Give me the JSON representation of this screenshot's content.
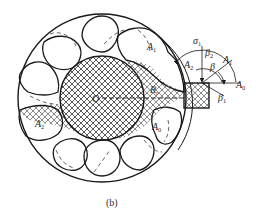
{
  "figure": {
    "caption": "(b)",
    "colors": {
      "stroke": "#1a1a1a",
      "hatch": "#3a3a3a",
      "dashed": "#555555",
      "background": "#ffffff"
    },
    "labels": {
      "center": "O",
      "radius": {
        "main": "R",
        "sub": "r"
      },
      "sigma1": {
        "main": "σ",
        "sub": "1"
      },
      "beta2": {
        "main": "β",
        "sub": "2"
      },
      "beta": {
        "main": "β",
        "sub": ""
      },
      "beta1": {
        "main": "β",
        "sub": "1"
      },
      "a1_right": {
        "main": "A",
        "sub": "1"
      },
      "a2_right": {
        "main": "A",
        "sub": "2"
      },
      "a0_right": {
        "main": "A",
        "sub": "0"
      },
      "a1_inner": {
        "main": "A",
        "sub": "1"
      },
      "a2_left": {
        "main": "A",
        "sub": "2"
      },
      "a0_lower": {
        "main": "A",
        "sub": "0"
      }
    },
    "components": [
      "outer-casing-circle",
      "rotor-hub-hatched",
      "flexible-lobes",
      "hatched-loading-block",
      "angle-arcs"
    ]
  }
}
